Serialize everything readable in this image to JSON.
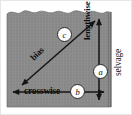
{
  "figure": {
    "background_color": "#ffffff",
    "fabric_color": "#8a8a8a",
    "arrow_color": "#141414",
    "marker_fill": "#fcfcfc",
    "marker_border": "#2b2b2b"
  },
  "labels": {
    "lengthwise": "lengthwise",
    "crosswise": "crosswise",
    "bias": "bias",
    "selvage": "selvage"
  },
  "markers": {
    "a": "a",
    "b": "b",
    "c": "c"
  },
  "edges": {
    "top_edge": "raw cut wavy edge",
    "right_edge": "selvage edge"
  },
  "arrows": {
    "lengthwise_arrow": "vertical double-headed arrow",
    "crosswise_arrow": "horizontal double-headed arrow",
    "bias_arrow": "diagonal double-headed arrow"
  }
}
